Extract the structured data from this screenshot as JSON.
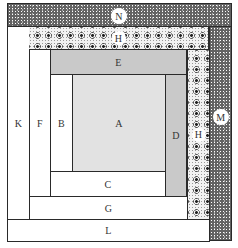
{
  "diagram": {
    "pieces": [
      {
        "id": "A",
        "label": "A",
        "fill": "light gray"
      },
      {
        "id": "B",
        "label": "B",
        "fill": "white"
      },
      {
        "id": "C",
        "label": "C",
        "fill": "white"
      },
      {
        "id": "D",
        "label": "D",
        "fill": "gray"
      },
      {
        "id": "E",
        "label": "E",
        "fill": "gray"
      },
      {
        "id": "F",
        "label": "F",
        "fill": "white"
      },
      {
        "id": "G",
        "label": "G",
        "fill": "white"
      },
      {
        "id": "H",
        "label": "H",
        "fill": "floral print"
      },
      {
        "id": "J",
        "label": "J",
        "fill": "floral print"
      },
      {
        "id": "K",
        "label": "K",
        "fill": "white"
      },
      {
        "id": "L",
        "label": "L",
        "fill": "white"
      },
      {
        "id": "M",
        "label": "M",
        "fill": "dark speckled print"
      },
      {
        "id": "N",
        "label": "N",
        "fill": "dark speckled print"
      }
    ]
  }
}
